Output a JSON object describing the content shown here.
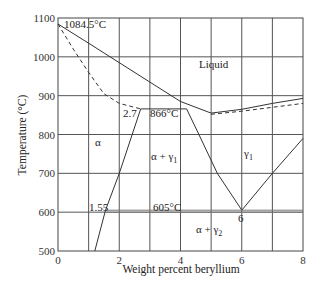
{
  "chart_data": {
    "type": "line",
    "title": "",
    "xlabel": "Weight percent beryllium",
    "ylabel": "Temperature (°C)",
    "xlim": [
      0,
      8
    ],
    "ylim": [
      500,
      1100
    ],
    "grid": true,
    "x_ticks": [
      "0",
      "2",
      "4",
      "6",
      "8"
    ],
    "y_ticks": [
      "500",
      "600",
      "700",
      "800",
      "900",
      "1000",
      "1100"
    ],
    "series": [
      {
        "name": "liquidus",
        "style": "solid",
        "points": [
          [
            0,
            1084.5
          ],
          [
            1,
            1035
          ],
          [
            2,
            985
          ],
          [
            3,
            935
          ],
          [
            4,
            885
          ],
          [
            5,
            855
          ],
          [
            6,
            865
          ],
          [
            7,
            880
          ],
          [
            8,
            893
          ]
        ]
      },
      {
        "name": "solidus",
        "style": "dashed",
        "points": [
          [
            0,
            1084.5
          ],
          [
            0.5,
            1020
          ],
          [
            1,
            960
          ],
          [
            1.5,
            905
          ],
          [
            2,
            880
          ],
          [
            2.7,
            866
          ]
        ]
      },
      {
        "name": "solidus_right",
        "style": "dashed",
        "points": [
          [
            5,
            852
          ],
          [
            6,
            860
          ],
          [
            7,
            870
          ],
          [
            8,
            880
          ]
        ]
      },
      {
        "name": "peritectic_866",
        "style": "solid",
        "points": [
          [
            2.7,
            866
          ],
          [
            4.2,
            866
          ]
        ]
      },
      {
        "name": "alpha_solvus",
        "style": "solid",
        "points": [
          [
            2.7,
            866
          ],
          [
            2.0,
            700
          ],
          [
            1.55,
            605
          ],
          [
            1.2,
            500
          ]
        ]
      },
      {
        "name": "gamma1_left_boundary",
        "style": "solid",
        "points": [
          [
            4.2,
            866
          ],
          [
            4.6,
            800
          ],
          [
            5.2,
            700
          ],
          [
            6,
            605
          ]
        ]
      },
      {
        "name": "gamma1_right_boundary",
        "style": "solid",
        "points": [
          [
            6,
            605
          ],
          [
            7,
            700
          ],
          [
            8,
            790
          ]
        ]
      },
      {
        "name": "eutectoid_605",
        "style": "double",
        "points": [
          [
            1.55,
            605
          ],
          [
            8,
            605
          ]
        ]
      }
    ],
    "annotations": [
      {
        "text": "1084.5°C",
        "x": 0.2,
        "y": 1090
      },
      {
        "text": "Liquid",
        "x": 4.5,
        "y": 965
      },
      {
        "text": "2.7",
        "x": 2.2,
        "y": 855
      },
      {
        "text": "866°C",
        "x": 3.0,
        "y": 855
      },
      {
        "text": "α",
        "x": 1.1,
        "y": 800
      },
      {
        "text": "α + γ1",
        "x": 2.6,
        "y": 760
      },
      {
        "text": "γ1",
        "x": 6.1,
        "y": 760
      },
      {
        "text": "1.55",
        "x": 0.8,
        "y": 620
      },
      {
        "text": "605°C",
        "x": 3.3,
        "y": 620
      },
      {
        "text": "6",
        "x": 5.9,
        "y": 588
      },
      {
        "text": "α + γ2",
        "x": 4.3,
        "y": 550
      }
    ]
  },
  "labels": {
    "melting": "1084.5°C",
    "liquid": "Liquid",
    "c27": "2.7",
    "t866": "866°C",
    "alpha": "α",
    "alpha_gamma1": "α + γ",
    "gamma": "γ",
    "sub1": "1",
    "sub2": "2",
    "c155": "1.55",
    "t605": "605°C",
    "c6": "6",
    "alpha_gamma2": "α + γ"
  }
}
